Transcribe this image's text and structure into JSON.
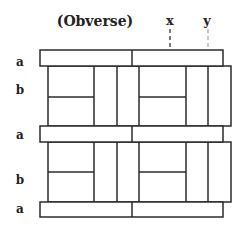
{
  "title": "(Obverse)",
  "markers": [
    {
      "label": "x",
      "x": 170,
      "color": "#333333"
    },
    {
      "label": "y",
      "x": 208,
      "color": "#999999"
    }
  ],
  "row_labels": [
    {
      "label": "a",
      "y": 64
    },
    {
      "label": "b",
      "y": 94
    },
    {
      "label": "a",
      "y": 138
    },
    {
      "label": "b",
      "y": 184
    },
    {
      "label": "a",
      "y": 213
    }
  ],
  "colors": {
    "line": "#2b2b2b",
    "background": "#ffffff"
  }
}
